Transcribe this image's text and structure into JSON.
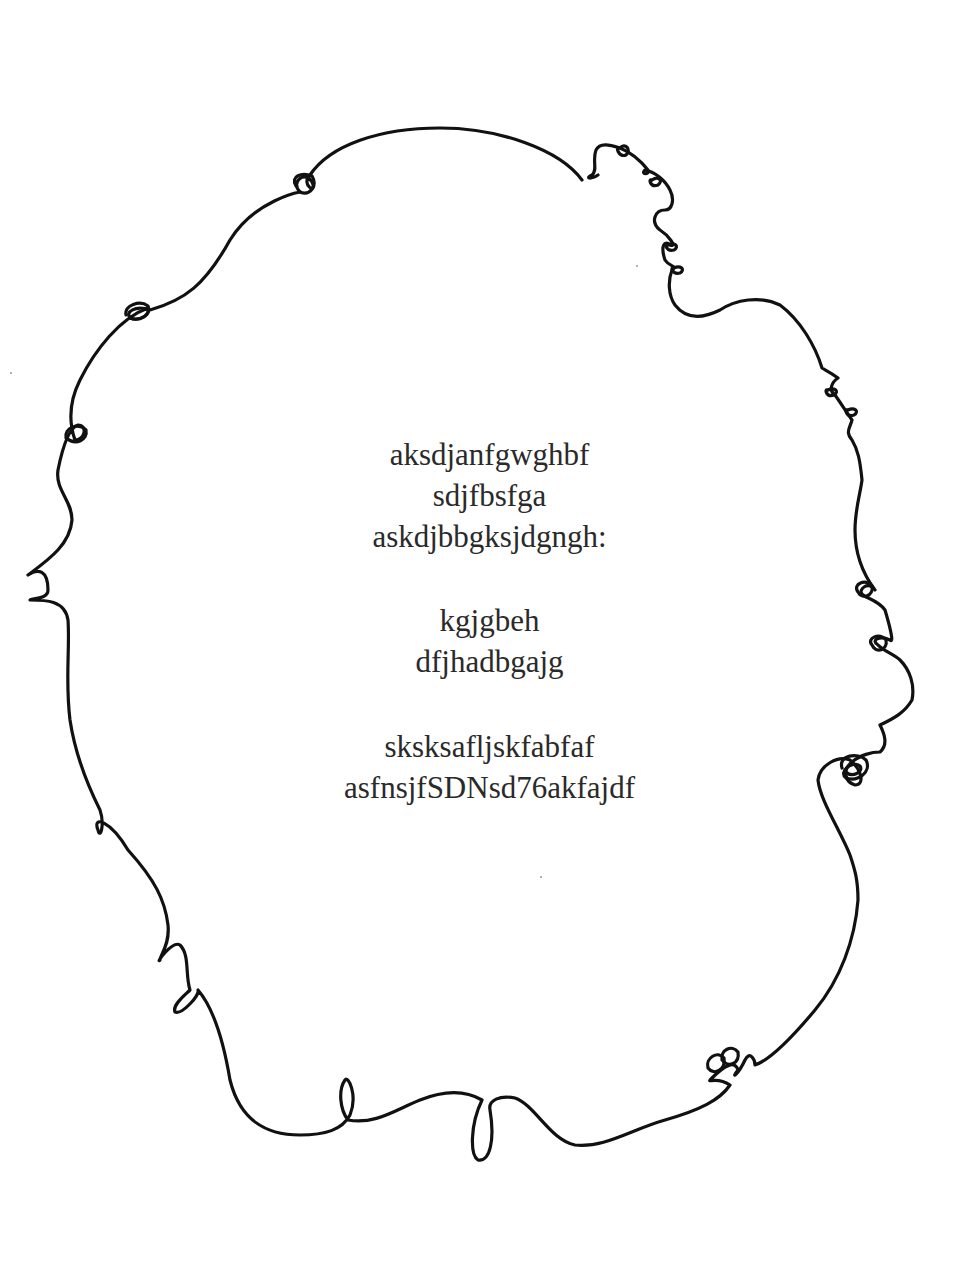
{
  "document": {
    "stanzas": [
      {
        "lines": [
          "aksdjanfgwghbf",
          "sdjfbsfga",
          "askdjbbgksjdgngh:"
        ]
      },
      {
        "lines": [
          "kgjgbeh",
          "dfjhadbgajg"
        ]
      },
      {
        "lines": [
          "sksksafljskfabfaf",
          "asfnsjfSDNsd76akfajdf"
        ]
      }
    ],
    "border": {
      "style": "hand-drawn curly loop frame",
      "color": "#111111"
    },
    "text_color": "#2a2a2a",
    "background": "#ffffff"
  }
}
